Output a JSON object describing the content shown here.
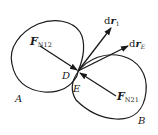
{
  "figure": {
    "bodies": [
      {
        "id": "A",
        "label": "A"
      },
      {
        "id": "B",
        "label": "B"
      }
    ],
    "contact_points": [
      {
        "id": "D",
        "label": "D",
        "on_body": "A"
      },
      {
        "id": "E",
        "label": "E",
        "on_body": "B"
      }
    ],
    "vectors": [
      {
        "id": "F_N12",
        "symbol": "F",
        "subscript": "N12",
        "description": "normal force on A from B"
      },
      {
        "id": "F_N21",
        "symbol": "F",
        "subscript": "N21",
        "description": "normal force on B from A"
      },
      {
        "id": "dr_1",
        "symbol": "dr",
        "subscript": "1",
        "description": "displacement of D"
      },
      {
        "id": "dr_E",
        "symbol": "dr",
        "subscript": "E",
        "description": "displacement of E"
      }
    ]
  },
  "labels": {
    "A": "A",
    "B": "B",
    "D": "D",
    "E": "E",
    "fn12_main": "F",
    "fn12_sub": "N12",
    "fn21_main": "F",
    "fn21_sub": "N21",
    "dr1_d": "d",
    "dr1_r": "r",
    "dr1_sub": "1",
    "dre_d": "d",
    "dre_r": "r",
    "dre_sub": "E"
  },
  "colors": {
    "stroke": "#1a1a1a",
    "background": "#ffffff"
  }
}
